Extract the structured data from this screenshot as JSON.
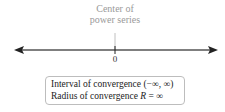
{
  "diagram": {
    "center_label_line1": "Center of",
    "center_label_line2": "power series",
    "axis_tick_label": "0",
    "box": {
      "line1": "Interval of convergence (−∞, ∞)",
      "line2_prefix": "Radius of convergence ",
      "line2_var": "R",
      "line2_suffix": " = ∞"
    },
    "colors": {
      "axis": "#555555",
      "label_gray": "#9a9a9a",
      "box_border": "#bdbdbd"
    }
  }
}
